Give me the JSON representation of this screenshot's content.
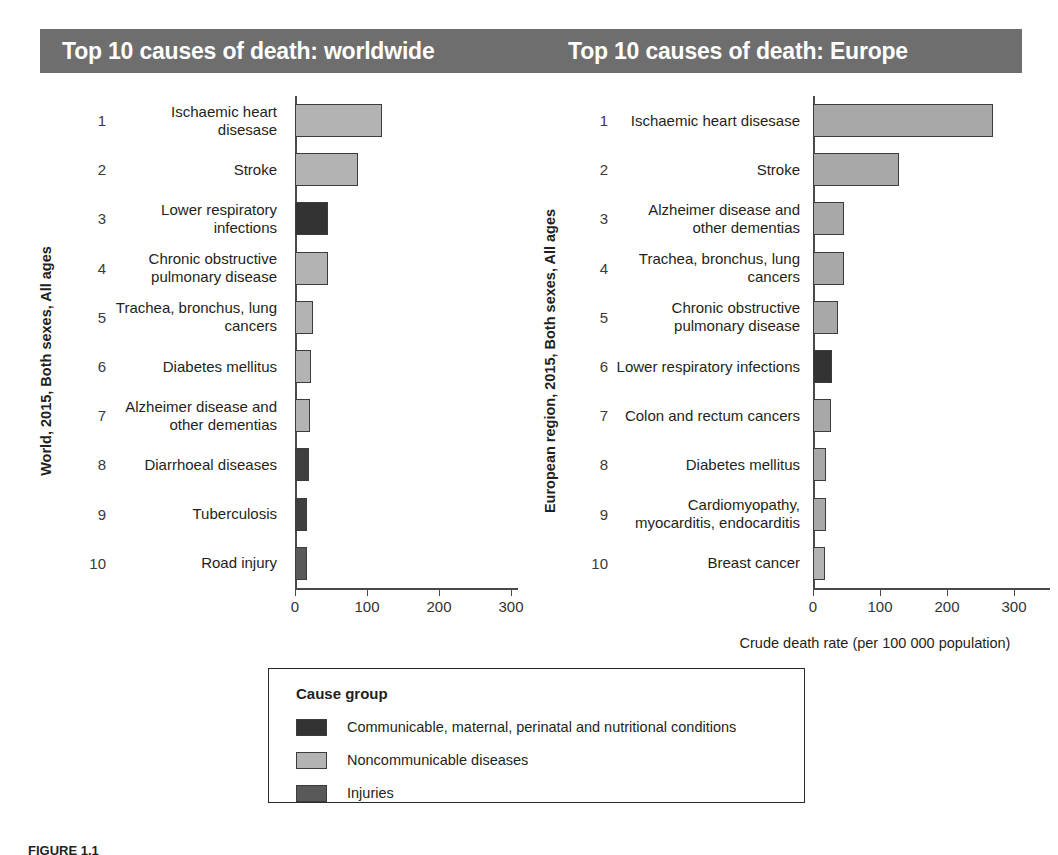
{
  "header": {
    "left_title": "Top 10 causes of death: worldwide",
    "right_title": "Top 10 causes of death: Europe",
    "band_color": "#6e6e6e"
  },
  "axis": {
    "xlabel": "Crude death rate (per 100 000 population)",
    "ticks": [
      "0",
      "100",
      "200",
      "300"
    ]
  },
  "legend": {
    "title": "Cause group",
    "entries": [
      {
        "label": "Communicable, maternal, perinatal and nutritional conditions",
        "color": "#333333"
      },
      {
        "label": "Noncommunicable diseases",
        "color": "#b3b3b3"
      },
      {
        "label": "Injuries",
        "color": "#595959"
      }
    ]
  },
  "caption": {
    "number": "FIGURE 1.1",
    "text": ""
  },
  "chart_data": [
    {
      "type": "bar",
      "title": "Top 10 causes of death: worldwide",
      "ylabel": "World, 2015, Both sexes, All ages",
      "xlabel": "Crude death rate (per 100 000 population)",
      "orientation": "horizontal",
      "xlim": [
        0,
        330
      ],
      "xticks": [
        0,
        100,
        200,
        300
      ],
      "grid": false,
      "ranks": [
        "1",
        "2",
        "3",
        "4",
        "5",
        "6",
        "7",
        "8",
        "9",
        "10"
      ],
      "categories": [
        "Ischaemic heart disesase",
        "Stroke",
        "Lower respiratory infections",
        "Chronic obstructive pulmonary disease",
        "Trachea, bronchus, lung cancers",
        "Diabetes mellitus",
        "Alzheimer disease and other dementias",
        "Diarrhoeal diseases",
        "Tuberculosis",
        "Road injury"
      ],
      "values": [
        121,
        88,
        46,
        46,
        25,
        22,
        21,
        19,
        17,
        16
      ],
      "groups": [
        "Noncommunicable diseases",
        "Noncommunicable diseases",
        "Communicable, maternal, perinatal and nutritional conditions",
        "Noncommunicable diseases",
        "Noncommunicable diseases",
        "Noncommunicable diseases",
        "Noncommunicable diseases",
        "Communicable, maternal, perinatal and nutritional conditions",
        "Communicable, maternal, perinatal and nutritional conditions",
        "Injuries"
      ],
      "colors": [
        "#b3b3b3",
        "#b3b3b3",
        "#333333",
        "#b3b3b3",
        "#b3b3b3",
        "#b3b3b3",
        "#b3b3b3",
        "#3f3f3f",
        "#3f3f3f",
        "#595959"
      ]
    },
    {
      "type": "bar",
      "title": "Top 10 causes of death: Europe",
      "ylabel": "European region, 2015, Both sexes, All ages",
      "xlabel": "Crude death rate (per 100 000 population)",
      "orientation": "horizontal",
      "xlim": [
        0,
        330
      ],
      "xticks": [
        0,
        100,
        200,
        300
      ],
      "grid": false,
      "ranks": [
        "1",
        "2",
        "3",
        "4",
        "5",
        "6",
        "7",
        "8",
        "9",
        "10"
      ],
      "categories": [
        "Ischaemic heart disesase",
        "Stroke",
        "Alzheimer disease and other dementias",
        "Trachea, bronchus, lung cancers",
        "Chronic obstructive pulmonary disease",
        "Lower respiratory infections",
        "Colon and rectum cancers",
        "Diabetes mellitus",
        "Cardiomyopathy, myocarditis, endocarditis",
        "Breast cancer"
      ],
      "values": [
        269,
        128,
        47,
        47,
        38,
        29,
        27,
        20,
        20,
        18
      ],
      "groups": [
        "Noncommunicable diseases",
        "Noncommunicable diseases",
        "Noncommunicable diseases",
        "Noncommunicable diseases",
        "Noncommunicable diseases",
        "Communicable, maternal, perinatal and nutritional conditions",
        "Noncommunicable diseases",
        "Noncommunicable diseases",
        "Noncommunicable diseases",
        "Noncommunicable diseases"
      ],
      "colors": [
        "#a8a8a8",
        "#a8a8a8",
        "#a8a8a8",
        "#a8a8a8",
        "#a8a8a8",
        "#333333",
        "#a8a8a8",
        "#a8a8a8",
        "#a8a8a8",
        "#b3b3b3"
      ]
    }
  ]
}
